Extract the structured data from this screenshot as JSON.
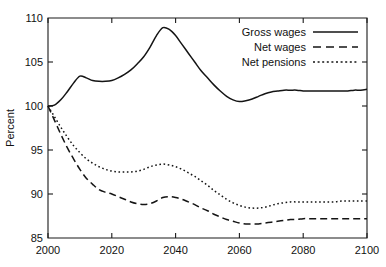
{
  "chart_data": {
    "type": "line",
    "title": "",
    "xlabel": "",
    "ylabel": "Percent",
    "xlim": [
      2000,
      2100
    ],
    "ylim": [
      85,
      110
    ],
    "xticks": [
      2000,
      2020,
      2040,
      2060,
      2080,
      2100
    ],
    "xtick_labels": [
      "2000",
      "2020",
      "2040",
      "2060",
      "2080",
      "2100"
    ],
    "yticks": [
      85,
      90,
      95,
      100,
      105,
      110
    ],
    "ytick_labels": [
      "85",
      "90",
      "95",
      "100",
      "105",
      "110"
    ],
    "grid": false,
    "legend_position": "top-right",
    "series": [
      {
        "name": "Gross wages",
        "style": "solid",
        "x": [
          2000,
          2002,
          2004,
          2006,
          2008,
          2010,
          2012,
          2014,
          2016,
          2018,
          2020,
          2022,
          2024,
          2026,
          2028,
          2030,
          2032,
          2034,
          2036,
          2038,
          2040,
          2042,
          2044,
          2046,
          2048,
          2050,
          2052,
          2054,
          2056,
          2058,
          2060,
          2062,
          2064,
          2066,
          2068,
          2070,
          2072,
          2074,
          2076,
          2078,
          2080,
          2082,
          2084,
          2086,
          2088,
          2090,
          2092,
          2094,
          2096,
          2098,
          2100
        ],
        "values": [
          100.0,
          100.1,
          100.7,
          101.6,
          102.6,
          103.4,
          103.2,
          102.9,
          102.8,
          102.8,
          102.9,
          103.2,
          103.6,
          104.1,
          104.8,
          105.6,
          106.7,
          108.0,
          108.9,
          108.7,
          108.0,
          107.0,
          106.0,
          105.0,
          104.0,
          103.2,
          102.4,
          101.7,
          101.1,
          100.7,
          100.5,
          100.6,
          100.8,
          101.1,
          101.4,
          101.6,
          101.7,
          101.8,
          101.8,
          101.8,
          101.7,
          101.7,
          101.7,
          101.7,
          101.7,
          101.7,
          101.7,
          101.7,
          101.8,
          101.8,
          101.9
        ]
      },
      {
        "name": "Net wages",
        "style": "dashed",
        "x": [
          2000,
          2002,
          2004,
          2006,
          2008,
          2010,
          2012,
          2014,
          2016,
          2018,
          2020,
          2022,
          2024,
          2026,
          2028,
          2030,
          2032,
          2034,
          2036,
          2038,
          2040,
          2042,
          2044,
          2046,
          2048,
          2050,
          2052,
          2054,
          2056,
          2058,
          2060,
          2062,
          2064,
          2066,
          2068,
          2070,
          2072,
          2074,
          2076,
          2078,
          2080,
          2082,
          2084,
          2086,
          2088,
          2090,
          2092,
          2094,
          2096,
          2098,
          2100
        ],
        "values": [
          100.0,
          98.4,
          96.8,
          95.3,
          94.0,
          92.8,
          91.8,
          91.1,
          90.5,
          90.2,
          90.0,
          89.7,
          89.4,
          89.1,
          88.9,
          88.8,
          88.9,
          89.2,
          89.6,
          89.7,
          89.6,
          89.4,
          89.1,
          88.8,
          88.4,
          88.1,
          87.7,
          87.4,
          87.1,
          86.9,
          86.7,
          86.6,
          86.6,
          86.6,
          86.7,
          86.8,
          86.9,
          87.0,
          87.1,
          87.1,
          87.2,
          87.2,
          87.2,
          87.2,
          87.2,
          87.2,
          87.2,
          87.2,
          87.2,
          87.2,
          87.2
        ]
      },
      {
        "name": "Net pensions",
        "style": "dotted",
        "x": [
          2000,
          2002,
          2004,
          2006,
          2008,
          2010,
          2012,
          2014,
          2016,
          2018,
          2020,
          2022,
          2024,
          2026,
          2028,
          2030,
          2032,
          2034,
          2036,
          2038,
          2040,
          2042,
          2044,
          2046,
          2048,
          2050,
          2052,
          2054,
          2056,
          2058,
          2060,
          2062,
          2064,
          2066,
          2068,
          2070,
          2072,
          2074,
          2076,
          2078,
          2080,
          2082,
          2084,
          2086,
          2088,
          2090,
          2092,
          2094,
          2096,
          2098,
          2100
        ],
        "values": [
          100.0,
          98.8,
          97.6,
          96.5,
          95.5,
          94.7,
          94.0,
          93.5,
          93.1,
          92.8,
          92.6,
          92.5,
          92.5,
          92.5,
          92.6,
          92.8,
          93.1,
          93.3,
          93.4,
          93.3,
          93.1,
          92.8,
          92.4,
          92.0,
          91.5,
          91.0,
          90.4,
          89.9,
          89.4,
          89.0,
          88.7,
          88.5,
          88.4,
          88.4,
          88.5,
          88.7,
          88.9,
          89.0,
          89.1,
          89.1,
          89.1,
          89.1,
          89.1,
          89.1,
          89.1,
          89.1,
          89.2,
          89.2,
          89.2,
          89.2,
          89.2
        ]
      }
    ],
    "legend": [
      {
        "label": "Gross wages",
        "style": "solid"
      },
      {
        "label": "Net wages",
        "style": "dashed"
      },
      {
        "label": "Net pensions",
        "style": "dotted"
      }
    ],
    "colors": {
      "line": "#141414",
      "axis": "#1a1a1a",
      "background": "#ffffff"
    }
  }
}
